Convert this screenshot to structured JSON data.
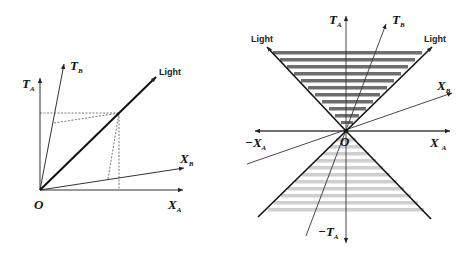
{
  "left_diagram": {
    "origin_label": "O",
    "axes": {
      "ta": {
        "main": "T",
        "sub": "A"
      },
      "tb": {
        "main": "T",
        "sub": "B"
      },
      "xa": {
        "main": "X",
        "sub": "A"
      },
      "xb": {
        "main": "X",
        "sub": "B"
      }
    },
    "light_label": "Light"
  },
  "right_diagram": {
    "origin_label": "O",
    "axes": {
      "ta": {
        "main": "T",
        "sub": "A"
      },
      "tb": {
        "main": "T",
        "sub": "B"
      },
      "xa": {
        "main": "X",
        "sub": "A"
      },
      "neg_xa": {
        "main": "−X",
        "sub": "A"
      },
      "xb": {
        "main": "X",
        "sub": "B"
      },
      "neg_ta": {
        "main": "−T",
        "sub": "A"
      }
    },
    "light_left_label": "Light",
    "light_right_label": "Light",
    "colors": {
      "future_cone_stripes": "#6e6e6e",
      "past_cone_stripes": "#cfcfcf"
    }
  }
}
